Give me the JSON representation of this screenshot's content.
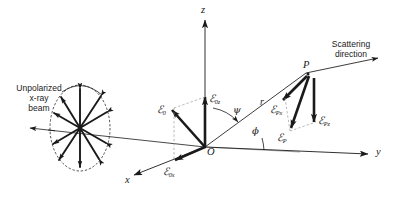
{
  "figure": {
    "background_color": "#ffffff",
    "line_color": "#1a1a1a",
    "width": 400,
    "height": 205
  },
  "axes": {
    "z": {
      "label": "z",
      "x": 201,
      "y": 6
    },
    "y": {
      "label": "y",
      "x": 378,
      "y": 148
    },
    "x": {
      "label": "x",
      "x": 127,
      "y": 176
    }
  },
  "origin": {
    "label": "O",
    "x": 205,
    "y": 147
  },
  "point_p": {
    "label": "P",
    "x": 306,
    "y": 68
  },
  "annotations": {
    "beam": {
      "line1": "Unpolarized",
      "line2": "x-ray",
      "line3": "beam",
      "x": 14,
      "y": 84
    },
    "scattering": {
      "line1": "Scattering",
      "line2": "direction",
      "x": 326,
      "y": 40
    },
    "radius": {
      "label": "r",
      "x": 262,
      "y": 103
    }
  },
  "angles": {
    "psi": {
      "symbol": "ψ",
      "x": 235,
      "y": 111
    },
    "phi": {
      "symbol": "ϕ",
      "x": 253,
      "y": 130
    }
  },
  "vectors": {
    "e0": {
      "symbol": "ℰ",
      "sub": "0",
      "x": 160,
      "y": 106
    },
    "e0z": {
      "symbol": "ℰ",
      "sub": "0z",
      "x": 203,
      "y": 94
    },
    "e0x": {
      "symbol": "ℰ",
      "sub": "0x",
      "x": 166,
      "y": 166
    },
    "epx": {
      "symbol": "ℰ",
      "sub": "Px",
      "x": 272,
      "y": 104
    },
    "epz": {
      "symbol": "ℰ",
      "sub": "Pz",
      "x": 317,
      "y": 114
    },
    "ep": {
      "symbol": "ℰ",
      "sub": "P",
      "x": 280,
      "y": 130
    }
  },
  "polarization_disc": {
    "description": "ellipse with radiating double-headed electric field vectors",
    "center_x": 80,
    "center_y": 128,
    "radius_x": 30,
    "radius_y": 43
  }
}
